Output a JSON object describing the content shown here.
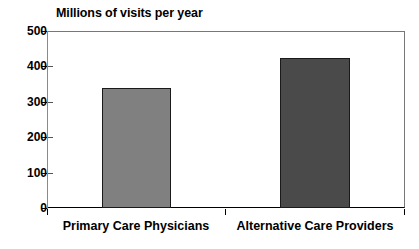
{
  "chart_data": {
    "type": "bar",
    "title": "Millions of visits per year",
    "xlabel": "",
    "ylabel": "",
    "ylim": [
      0,
      500
    ],
    "yticks": [
      "0",
      "100",
      "200",
      "300",
      "400",
      "500"
    ],
    "grid": false,
    "legend": "none",
    "categories": [
      "Primary Care Physicians",
      "Alternative Care Providers"
    ],
    "values": [
      340,
      425
    ],
    "colors": [
      "#808080",
      "#4a4a4a"
    ],
    "bar_border_color": "#1a1a1a"
  },
  "axis": {
    "tick_500": "500",
    "tick_400": "400",
    "tick_300": "300",
    "tick_200": "200",
    "tick_100": "100",
    "tick_0": "0"
  },
  "labels": {
    "category_1": "Primary Care Physicians",
    "category_2": "Alternative Care Providers"
  }
}
